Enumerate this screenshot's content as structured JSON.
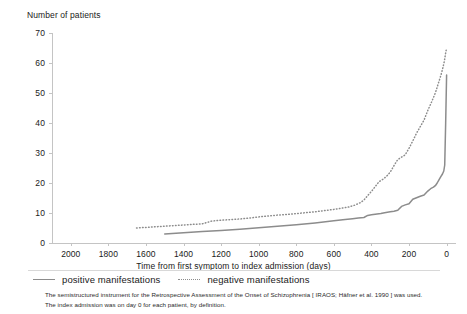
{
  "chart_data": {
    "type": "line",
    "title": "",
    "xlabel": "Time from first symptom to index admission (days)",
    "ylabel": "Number of patients",
    "xlim": [
      2100,
      -50
    ],
    "ylim": [
      0,
      70
    ],
    "x_reversed": true,
    "grid": false,
    "legend_position": "below-axis",
    "xticks": [
      2000,
      1800,
      1600,
      1400,
      1200,
      1000,
      800,
      600,
      400,
      200,
      0
    ],
    "yticks": [
      0,
      10,
      20,
      30,
      40,
      50,
      60,
      70
    ],
    "series": [
      {
        "name": "positive manifestations",
        "style": "solid",
        "color": "#8c8c8c",
        "x": [
          1500,
          1400,
          1300,
          1200,
          1100,
          1000,
          900,
          800,
          700,
          600,
          540,
          500,
          470,
          440,
          420,
          400,
          380,
          350,
          330,
          300,
          280,
          260,
          240,
          220,
          200,
          180,
          160,
          140,
          120,
          100,
          85,
          70,
          60,
          50,
          40,
          30,
          22,
          15,
          10,
          5,
          0
        ],
        "y": [
          3,
          3.4,
          3.8,
          4.2,
          4.6,
          5.1,
          5.6,
          6.1,
          6.7,
          7.4,
          7.8,
          8.1,
          8.3,
          8.5,
          9.2,
          9.4,
          9.6,
          9.8,
          10.1,
          10.4,
          10.6,
          10.9,
          12.2,
          12.7,
          13.1,
          14.6,
          15.1,
          15.6,
          16.0,
          17.3,
          18.1,
          18.6,
          19.1,
          20.0,
          21.1,
          22.2,
          23.0,
          24.0,
          26.0,
          40.0,
          56.0
        ]
      },
      {
        "name": "negative manifestations",
        "style": "dotted",
        "color": "#8c8c8c",
        "x": [
          1650,
          1600,
          1500,
          1400,
          1300,
          1250,
          1200,
          1150,
          1100,
          1050,
          1000,
          950,
          900,
          850,
          800,
          750,
          700,
          650,
          600,
          560,
          520,
          490,
          460,
          440,
          420,
          400,
          380,
          360,
          340,
          320,
          300,
          280,
          260,
          240,
          220,
          200,
          180,
          160,
          140,
          120,
          100,
          80,
          60,
          45,
          30,
          20,
          12,
          6,
          0
        ],
        "y": [
          5.0,
          5.2,
          5.6,
          6.0,
          6.4,
          7.3,
          7.6,
          7.8,
          8.0,
          8.3,
          8.7,
          9.0,
          9.3,
          9.5,
          9.8,
          10.1,
          10.4,
          10.8,
          11.2,
          11.6,
          12.0,
          12.6,
          13.4,
          14.3,
          15.8,
          17.2,
          18.8,
          20.4,
          21.2,
          22.2,
          23.6,
          25.8,
          27.8,
          28.6,
          29.4,
          31.6,
          34.0,
          36.6,
          38.8,
          41.0,
          44.2,
          47.0,
          50.0,
          53.0,
          56.0,
          58.4,
          60.6,
          63.0,
          65.0
        ]
      }
    ]
  },
  "axes": {
    "y_title": "Number of patients",
    "x_title": "Time from first symptom to index admission (days)",
    "yticks": [
      "70",
      "60",
      "50",
      "40",
      "30",
      "20",
      "10",
      "0"
    ],
    "xticks": [
      "2000",
      "1800",
      "1600",
      "1400",
      "1200",
      "1000",
      "800",
      "600",
      "400",
      "200",
      "0"
    ]
  },
  "legend": {
    "entries": [
      {
        "label": "positive manifestations",
        "style": "solid"
      },
      {
        "label": "negative manifestations",
        "style": "dotted"
      }
    ]
  },
  "footnote": {
    "line1": "The semistructured instrument for the Retrospective Assessment of the Onset of Schizophrenia [ IRAOS; Häfner et al. 1990 ] was used.",
    "line2": "The index admission was on day 0 for each patient, by definition."
  }
}
